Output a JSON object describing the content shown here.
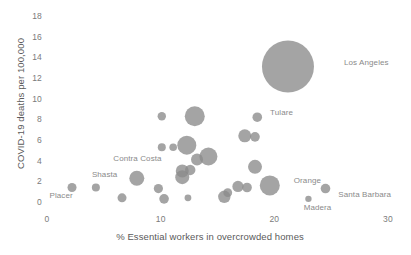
{
  "chart_data": {
    "type": "scatter",
    "title": "",
    "xlabel": "% Essential workers in overcrowded homes",
    "ylabel": "COVID-19 deaths per 100,000",
    "xlim": [
      0,
      30
    ],
    "ylim": [
      0,
      18
    ],
    "xticks": [
      0,
      10,
      20,
      30
    ],
    "yticks": [
      0,
      2,
      4,
      6,
      8,
      10,
      12,
      14,
      16,
      18
    ],
    "xtick_labels": [
      "0",
      "10",
      "20",
      "30"
    ],
    "ytick_labels": [
      "0",
      "2",
      "4",
      "6",
      "8",
      "10",
      "12",
      "14",
      "16",
      "18"
    ],
    "grid": false,
    "legend": "none",
    "bubble_color": "#8b8b8b",
    "bubble_opacity": 0.78,
    "size_encodes": "population",
    "points": [
      {
        "label": "Placer",
        "x": 2.2,
        "y": 1.5,
        "r": 4.5,
        "label_dx": -27,
        "label_dy": 8
      },
      {
        "label": "Shasta",
        "x": 4.3,
        "y": 1.5,
        "r": 4.0,
        "label_dx": -8,
        "label_dy": -13
      },
      {
        "label": "",
        "x": 6.6,
        "y": 0.5,
        "r": 4.5,
        "label_dx": 0,
        "label_dy": 0
      },
      {
        "label": "Contra Costa",
        "x": 7.9,
        "y": 2.4,
        "r": 7.5,
        "label_dx": -31,
        "label_dy": -19
      },
      {
        "label": "",
        "x": 9.8,
        "y": 1.4,
        "r": 4.6,
        "label_dx": 0,
        "label_dy": 0
      },
      {
        "label": "",
        "x": 10.3,
        "y": 0.4,
        "r": 4.8,
        "label_dx": 0,
        "label_dy": 0
      },
      {
        "label": "",
        "x": 10.1,
        "y": 8.4,
        "r": 4.2,
        "label_dx": 0,
        "label_dy": 0
      },
      {
        "label": "",
        "x": 10.1,
        "y": 5.4,
        "r": 4.0,
        "label_dx": 0,
        "label_dy": 0
      },
      {
        "label": "",
        "x": 11.1,
        "y": 5.4,
        "r": 3.8,
        "label_dx": 0,
        "label_dy": 0
      },
      {
        "label": "",
        "x": 12.4,
        "y": 0.5,
        "r": 3.4,
        "label_dx": 0,
        "label_dy": 0
      },
      {
        "label": "",
        "x": 11.9,
        "y": 2.5,
        "r": 7.0,
        "label_dx": 0,
        "label_dy": 0
      },
      {
        "label": "",
        "x": 11.9,
        "y": 3.1,
        "r": 6.5,
        "label_dx": 0,
        "label_dy": 0
      },
      {
        "label": "",
        "x": 12.6,
        "y": 3.2,
        "r": 5.2,
        "label_dx": 0,
        "label_dy": 0
      },
      {
        "label": "",
        "x": 12.3,
        "y": 5.6,
        "r": 9.5,
        "label_dx": 0,
        "label_dy": 0
      },
      {
        "label": "",
        "x": 13.0,
        "y": 8.4,
        "r": 10.0,
        "label_dx": 0,
        "label_dy": 0
      },
      {
        "label": "",
        "x": 13.2,
        "y": 4.2,
        "r": 6.0,
        "label_dx": 0,
        "label_dy": 0
      },
      {
        "label": "",
        "x": 14.2,
        "y": 4.5,
        "r": 9.0,
        "label_dx": 0,
        "label_dy": 0
      },
      {
        "label": "",
        "x": 15.6,
        "y": 0.6,
        "r": 6.2,
        "label_dx": 0,
        "label_dy": 0
      },
      {
        "label": "",
        "x": 15.9,
        "y": 1.0,
        "r": 4.4,
        "label_dx": 0,
        "label_dy": 0
      },
      {
        "label": "",
        "x": 16.8,
        "y": 1.6,
        "r": 5.6,
        "label_dx": 0,
        "label_dy": 0
      },
      {
        "label": "",
        "x": 17.6,
        "y": 1.5,
        "r": 4.8,
        "label_dx": 0,
        "label_dy": 0
      },
      {
        "label": "",
        "x": 17.4,
        "y": 6.5,
        "r": 6.5,
        "label_dx": 0,
        "label_dy": 0
      },
      {
        "label": "",
        "x": 18.3,
        "y": 6.4,
        "r": 4.8,
        "label_dx": 0,
        "label_dy": 0
      },
      {
        "label": "Tulare",
        "x": 18.5,
        "y": 8.3,
        "r": 4.8,
        "label_dx": 8,
        "label_dy": -4
      },
      {
        "label": "",
        "x": 18.3,
        "y": 3.5,
        "r": 7.0,
        "label_dx": 0,
        "label_dy": 0
      },
      {
        "label": "Orange",
        "x": 19.6,
        "y": 1.7,
        "r": 10.0,
        "label_dx": 14,
        "label_dy": -4
      },
      {
        "label": "Los Angeles",
        "x": 21.2,
        "y": 13.2,
        "r": 26.0,
        "label_dx": 30,
        "label_dy": -4
      },
      {
        "label": "Madera",
        "x": 23.0,
        "y": 0.4,
        "r": 3.2,
        "label_dx": -8,
        "label_dy": 9
      },
      {
        "label": "Santa Barbara",
        "x": 24.5,
        "y": 1.4,
        "r": 4.8,
        "label_dx": 8,
        "label_dy": 6
      }
    ]
  }
}
